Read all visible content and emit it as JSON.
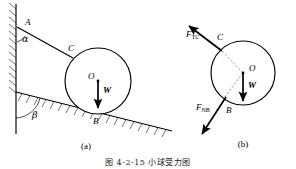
{
  "figure": {
    "caption": "图 4-2-15  小球受力图",
    "panels": [
      {
        "id": "a",
        "label": "(a)",
        "title": "space-diagram"
      },
      {
        "id": "b",
        "label": "(b)",
        "title": "free-body-diagram"
      }
    ]
  },
  "panel_a": {
    "points": {
      "A": "A",
      "B": "B",
      "C": "C",
      "O": "O"
    },
    "angles": {
      "alpha": "α",
      "beta": "β"
    },
    "forces": {
      "weight": "W"
    }
  },
  "panel_b": {
    "points": {
      "B": "B",
      "C": "C",
      "O": "O"
    },
    "forces": {
      "cord_tension_main": "F",
      "cord_tension_sub": "TC",
      "normal_main": "F",
      "normal_sub": "NB",
      "weight": "W"
    }
  },
  "colors": {
    "ink": "#000000",
    "paper": "#ffffff",
    "dashed": "#555555"
  }
}
